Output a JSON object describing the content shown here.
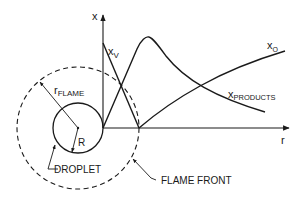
{
  "diagram": {
    "axes": {
      "y_label": "x",
      "x_label": "r"
    },
    "curves": {
      "fuel_vapor": {
        "symbol": "x",
        "subscript": "V"
      },
      "oxidizer": {
        "symbol": "x",
        "subscript": "O"
      },
      "products": {
        "symbol": "x",
        "subscript": "PRODUCTS"
      }
    },
    "geometry_labels": {
      "flame_radius": {
        "symbol": "r",
        "subscript": "FLAME"
      },
      "droplet_radius": "R",
      "droplet": "DROPLET",
      "flame_front": "FLAME FRONT"
    },
    "colors": {
      "stroke": "#1a1a1a",
      "background": "#ffffff"
    }
  }
}
